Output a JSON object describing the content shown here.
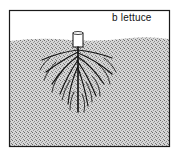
{
  "figure": {
    "panel_label": "b  lettuce",
    "colors": {
      "frame": "#1a1a1a",
      "sky": "#ffffff",
      "soil": "#c8c8c8",
      "roots": "#111111"
    }
  }
}
